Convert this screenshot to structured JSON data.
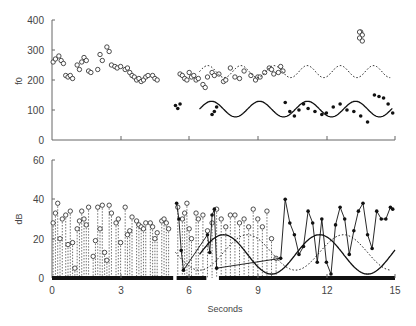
{
  "chart_data": [
    {
      "type": "scatter",
      "panel": "top",
      "title": "",
      "xlabel": "",
      "ylabel": "f0",
      "xlim": [
        0,
        15
      ],
      "ylim": [
        0,
        400
      ],
      "yticks": [
        0,
        100,
        200,
        300,
        400
      ],
      "xticks": [
        0,
        3,
        6,
        9,
        12,
        15
      ],
      "grid": false,
      "legend": null,
      "series": [
        {
          "name": "open-circles",
          "marker": "open-circle",
          "x": [
            0.05,
            0.15,
            0.3,
            0.4,
            0.5,
            0.6,
            0.7,
            0.8,
            0.9,
            1.1,
            1.2,
            1.3,
            1.4,
            1.5,
            1.6,
            1.7,
            2.0,
            2.1,
            2.2,
            2.4,
            2.5,
            2.6,
            2.75,
            2.85,
            3.0,
            3.2,
            3.3,
            3.4,
            3.5,
            3.6,
            3.7,
            3.8,
            3.9,
            4.0,
            4.1,
            4.2,
            4.4,
            4.5,
            4.6,
            5.6,
            5.7,
            5.8,
            5.9,
            6.0,
            6.1,
            6.2,
            6.3,
            6.4,
            6.6,
            6.7,
            6.8,
            7.0,
            7.1,
            7.3,
            7.5,
            7.6,
            7.8,
            8.0,
            8.2,
            8.4,
            8.7,
            8.9,
            9.0,
            9.1,
            9.3,
            9.5,
            9.6,
            9.7,
            9.9,
            10.0,
            10.1,
            13.5
          ],
          "y": [
            260,
            270,
            280,
            265,
            255,
            215,
            210,
            215,
            205,
            250,
            235,
            260,
            275,
            265,
            230,
            225,
            235,
            285,
            265,
            310,
            295,
            250,
            245,
            240,
            245,
            235,
            240,
            225,
            215,
            210,
            200,
            205,
            195,
            200,
            210,
            215,
            215,
            205,
            200,
            220,
            215,
            205,
            200,
            225,
            210,
            215,
            200,
            205,
            185,
            175,
            210,
            225,
            215,
            220,
            195,
            200,
            240,
            210,
            205,
            230,
            215,
            200,
            210,
            210,
            225,
            240,
            235,
            220,
            225,
            245,
            230,
            360
          ],
          "y_cluster_high": [
            360,
            350,
            340,
            330
          ]
        },
        {
          "name": "filled-dots",
          "marker": "filled-dot",
          "x": [
            5.4,
            5.5,
            5.6,
            7.0,
            7.1,
            7.2,
            10.2,
            10.4,
            10.6,
            10.8,
            11.0,
            11.2,
            11.5,
            11.8,
            12.0,
            12.3,
            12.6,
            12.9,
            13.2,
            13.5,
            13.8,
            14.1,
            14.3,
            14.5,
            14.7,
            14.9
          ],
          "y": [
            115,
            105,
            120,
            85,
            95,
            110,
            125,
            95,
            80,
            100,
            120,
            105,
            95,
            85,
            90,
            110,
            120,
            100,
            95,
            80,
            60,
            150,
            145,
            140,
            120,
            90
          ]
        },
        {
          "name": "dotted-sinusoid",
          "line": "dotted",
          "x_range": [
            6.45,
            14.8
          ],
          "center": 228,
          "amplitude": 20,
          "period_s": 1.45
        },
        {
          "name": "solid-sinusoid",
          "line": "solid",
          "x_range": [
            6.45,
            14.9
          ],
          "center": 103,
          "amplitude": 26,
          "period_s": 2.1
        }
      ]
    },
    {
      "type": "scatter",
      "panel": "bottom",
      "title": "",
      "xlabel": "Seconds",
      "ylabel": "dB",
      "xlim": [
        0,
        15
      ],
      "ylim": [
        0,
        60
      ],
      "yticks": [
        0,
        20,
        40,
        60
      ],
      "xticks": [
        0,
        3,
        6,
        9,
        12,
        15
      ],
      "grid": false,
      "legend": null,
      "series": [
        {
          "name": "open-circles-dotted-stems",
          "marker": "open-circle",
          "x": [
            0.05,
            0.15,
            0.25,
            0.35,
            0.45,
            0.6,
            0.7,
            0.8,
            0.9,
            1.0,
            1.1,
            1.2,
            1.3,
            1.4,
            1.5,
            1.6,
            1.8,
            1.9,
            2.0,
            2.1,
            2.2,
            2.3,
            2.4,
            2.5,
            2.6,
            2.8,
            2.9,
            3.0,
            3.2,
            3.3,
            3.4,
            3.5,
            3.7,
            3.8,
            3.9,
            4.0,
            4.1,
            4.3,
            4.4,
            4.5,
            4.6,
            4.8,
            4.9,
            5.0,
            5.1,
            5.5,
            5.7,
            5.8,
            5.9,
            6.0,
            6.1,
            6.3,
            6.4,
            6.6,
            6.8,
            7.0,
            7.2,
            7.4,
            7.6,
            7.8,
            8.0,
            8.2,
            8.4,
            8.6,
            8.8,
            9.0,
            9.2,
            9.4,
            9.6,
            9.8
          ],
          "y": [
            28,
            33,
            38,
            20,
            30,
            32,
            17,
            34,
            18,
            5,
            25,
            29,
            34,
            30,
            27,
            36,
            11,
            19,
            36,
            25,
            37,
            13,
            9,
            37,
            33,
            28,
            30,
            18,
            36,
            22,
            24,
            31,
            29,
            27,
            26,
            25,
            28,
            28,
            26,
            20,
            23,
            29,
            30,
            28,
            25,
            36,
            30,
            33,
            38,
            25,
            20,
            33,
            30,
            32,
            24,
            28,
            35,
            30,
            26,
            32,
            32,
            28,
            30,
            26,
            35,
            30,
            26,
            34,
            20,
            10
          ],
          "stem_to": 0
        },
        {
          "name": "filled-dots-solid-line",
          "marker": "filled-dot",
          "x": [
            5.45,
            5.55,
            5.65,
            5.75,
            6.8,
            6.9,
            7.0,
            7.1,
            7.2,
            10.0,
            10.2,
            10.4,
            10.6,
            10.8,
            11.0,
            11.2,
            11.4,
            11.6,
            11.8,
            12.0,
            12.2,
            12.4,
            12.6,
            12.8,
            13.0,
            13.2,
            13.4,
            13.6,
            13.8,
            14.0,
            14.2,
            14.4,
            14.6,
            14.8,
            14.9
          ],
          "y": [
            38,
            30,
            14,
            4,
            22,
            13,
            32,
            35,
            5,
            10,
            40,
            28,
            22,
            12,
            16,
            34,
            28,
            8,
            30,
            8,
            2,
            27,
            36,
            30,
            12,
            24,
            34,
            38,
            22,
            15,
            34,
            30,
            30,
            36,
            35
          ]
        },
        {
          "name": "solid-sinusoid",
          "line": "solid",
          "x_range": [
            6.45,
            15.0
          ],
          "center": 12,
          "amplitude": 10,
          "period_s": 4.2
        },
        {
          "name": "dotted-sinusoid",
          "line": "dotted",
          "x_range": [
            5.4,
            14.8
          ],
          "center": 13,
          "amplitude": 9,
          "period_s": 4.2
        },
        {
          "name": "voicing-bar",
          "line": "thick-bar",
          "y": 0,
          "segments": [
            [
              0,
              5.3
            ],
            [
              5.45,
              6.75
            ],
            [
              7.3,
              15.0
            ]
          ]
        }
      ]
    }
  ],
  "labels": {
    "top_ylabel": "f0",
    "bottom_ylabel": "dB",
    "xlabel": "Seconds",
    "top_yticks": [
      "400",
      "300",
      "200",
      "100",
      "0"
    ],
    "bottom_yticks": [
      "60",
      "40",
      "20",
      "0"
    ],
    "xticks": [
      "0",
      "3",
      "6",
      "9",
      "12",
      "15"
    ]
  },
  "colors": {
    "ink": "#111111",
    "axis": "#555555",
    "text": "#444444",
    "background": "#ffffff"
  }
}
